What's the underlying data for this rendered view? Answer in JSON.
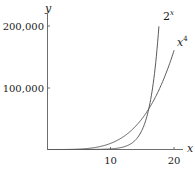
{
  "chart_data": {
    "type": "line",
    "title": "",
    "xlabel": "x",
    "ylabel": "y",
    "xlim": [
      0,
      21
    ],
    "ylim": [
      0,
      210000
    ],
    "grid": false,
    "legend": "inline labels at curve ends",
    "x_ticks": [
      10,
      20
    ],
    "x_tick_labels": [
      "10",
      "20"
    ],
    "y_ticks": [
      100000,
      200000
    ],
    "y_tick_labels": [
      "100,000",
      "200,000"
    ],
    "series": [
      {
        "name": "2^x",
        "label_base": "2",
        "label_exp": "x",
        "x": [
          0,
          4,
          8,
          10,
          12,
          14,
          15,
          16,
          17,
          17.6
        ],
        "values": [
          1,
          16,
          256,
          1024,
          4096,
          16384,
          32768,
          65536,
          131072,
          198668
        ]
      },
      {
        "name": "x^4",
        "label_base": "x",
        "label_exp": "4",
        "x": [
          0,
          4,
          8,
          10,
          12,
          14,
          16,
          18,
          20
        ],
        "values": [
          0,
          256,
          4096,
          10000,
          20736,
          38416,
          65536,
          104976,
          160000
        ]
      }
    ],
    "annotations": [
      "curves intersect near x = 16 (y = 65,536)"
    ]
  },
  "colors": {
    "axis": "#6e6e6e",
    "curve": "#5a5a5a",
    "text": "#1a1a1a"
  }
}
